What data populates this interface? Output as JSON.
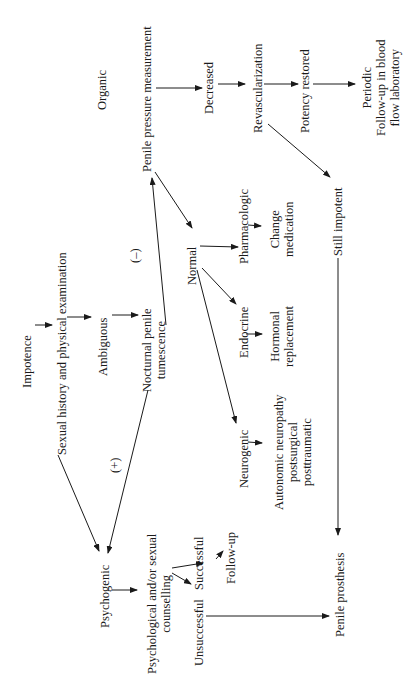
{
  "diagram": {
    "title_nodes": {
      "impotence": "Impotence",
      "history": "Sexual history and physical examination",
      "ambiguous": "Ambiguous",
      "npt_1": "Nocturnal penile",
      "npt_2": "tumescence",
      "plus": "(+)",
      "minus": "(–)",
      "organic": "Organic",
      "ppm": "Penile pressure measurement",
      "decreased": "Decreased",
      "revasc": "Revascularization",
      "potency": "Potency restored",
      "periodic_1": "Periodic",
      "periodic_2": "Follow-up in blood",
      "periodic_3": "flow laboratory",
      "normal": "Normal",
      "pharma": "Pharmacologic",
      "change_1": "Change",
      "change_2": "medication",
      "endocrine": "Endocrine",
      "hormonal_1": "Hormonal",
      "hormonal_2": "replacement",
      "neurogenic": "Neurogenic",
      "auto_1": "Autonomic neuropathy",
      "auto_2": "postsurgical",
      "auto_3": "posttraumatic",
      "still": "Still impotent",
      "psychogenic": "Psychogenic",
      "counsel_1": "Psychological and/or sexual",
      "counsel_2": "counselling",
      "successful": "Successful",
      "unsuccessful": "Unsuccessful",
      "followup": "Follow-up",
      "prosthesis": "Penile prosthesis"
    }
  }
}
